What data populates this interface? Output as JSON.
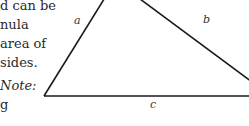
{
  "text_column": {
    "lines": [
      "d can be",
      "nula",
      "area of",
      "sides.",
      "Note:",
      "g"
    ]
  },
  "figure": {
    "type": "triangle",
    "side_labels": {
      "a": "a",
      "b": "b",
      "c": "c"
    },
    "line_color": "#1a1a1a"
  }
}
